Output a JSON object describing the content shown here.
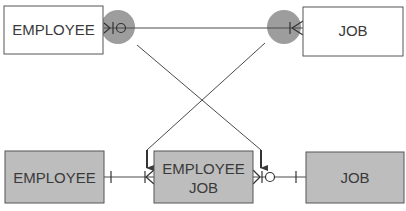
{
  "diagram": {
    "top_row": {
      "left_entity": {
        "label": "EMPLOYEE",
        "fill": "#ffffff"
      },
      "right_entity": {
        "label": "JOB",
        "fill": "#ffffff"
      },
      "relationship": {
        "left_end": "crow-foot-zero-or-many",
        "right_end": "crow-foot-one-or-many",
        "highlight_color": "#8c8c8c"
      }
    },
    "bottom_row": {
      "left_entity": {
        "label": "EMPLOYEE",
        "fill": "#bdbdbd"
      },
      "middle_entity": {
        "label_line1": "EMPLOYEE",
        "label_line2": "JOB",
        "fill": "#bdbdbd"
      },
      "right_entity": {
        "label": "JOB",
        "fill": "#bdbdbd"
      },
      "left_relationship": {
        "employee_end": "exactly-one",
        "associative_end": "one-or-many"
      },
      "right_relationship": {
        "associative_end": "zero-or-many",
        "job_end": "exactly-one"
      }
    },
    "colors": {
      "line": "#4a4a4a",
      "border": "#555555",
      "text": "#3a3a3a"
    }
  }
}
